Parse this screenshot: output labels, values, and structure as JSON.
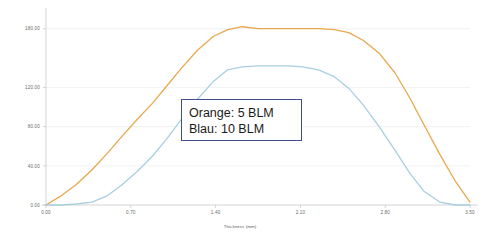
{
  "chart_data": {
    "type": "line",
    "title": "",
    "subtitle": "",
    "xlabel": "Thickness (mm)",
    "ylabel": "",
    "xlim": [
      0.0,
      3.5
    ],
    "ylim": [
      0.0,
      195.0
    ],
    "grid": true,
    "grid_axis": "y",
    "legend_position": "center",
    "xticks": [
      "0.00",
      "0.70",
      "1.40",
      "2.10",
      "2.80",
      "3.50"
    ],
    "xtick_values": [
      0.0,
      0.7,
      1.4,
      2.1,
      2.8,
      3.5
    ],
    "yticks": [
      "0.00",
      "40.00",
      "80.00",
      "120.00",
      "180.00"
    ],
    "ytick_values": [
      0,
      40,
      80,
      120,
      180
    ],
    "annotations": [
      {
        "name": "legend-callout",
        "lines": [
          "Orange: 5 BLM",
          "Blau: 10 BLM"
        ]
      }
    ],
    "series": [
      {
        "name": "Orange: 5 BLM",
        "label": "5 BLM",
        "color": "#e8a84f",
        "x": [
          0.0,
          0.12,
          0.25,
          0.38,
          0.5,
          0.62,
          0.75,
          0.88,
          1.0,
          1.12,
          1.25,
          1.38,
          1.5,
          1.62,
          1.75,
          1.88,
          2.0,
          2.12,
          2.25,
          2.38,
          2.5,
          2.62,
          2.75,
          2.88,
          3.0,
          3.12,
          3.25,
          3.38,
          3.5
        ],
        "y": [
          0,
          9,
          21,
          36,
          52,
          69,
          87,
          104,
          122,
          140,
          158,
          172,
          179,
          182,
          180,
          180,
          180,
          180,
          180,
          179,
          176,
          168,
          155,
          135,
          110,
          82,
          52,
          24,
          3
        ]
      },
      {
        "name": "Blau: 10 BLM",
        "label": "10 BLM",
        "color": "#a8cfe0",
        "x": [
          0.0,
          0.12,
          0.25,
          0.38,
          0.5,
          0.62,
          0.75,
          0.88,
          1.0,
          1.12,
          1.25,
          1.38,
          1.5,
          1.62,
          1.75,
          1.88,
          2.0,
          2.12,
          2.25,
          2.38,
          2.5,
          2.62,
          2.75,
          2.88,
          3.0,
          3.12,
          3.25,
          3.38,
          3.5
        ],
        "y": [
          0,
          0,
          1,
          3,
          9,
          20,
          34,
          50,
          68,
          88,
          108,
          126,
          138,
          141,
          142,
          142,
          142,
          141,
          138,
          131,
          119,
          102,
          80,
          56,
          33,
          14,
          3,
          0,
          0
        ]
      }
    ]
  },
  "colors": {
    "orange_series": "#e8a84f",
    "blue_series": "#a8cfe0",
    "legend_border": "#3f4e8c",
    "axis": "#c9c9c9",
    "grid": "#e4e4e4",
    "tick_label": "#6b6b6b",
    "background": "#ffffff"
  }
}
